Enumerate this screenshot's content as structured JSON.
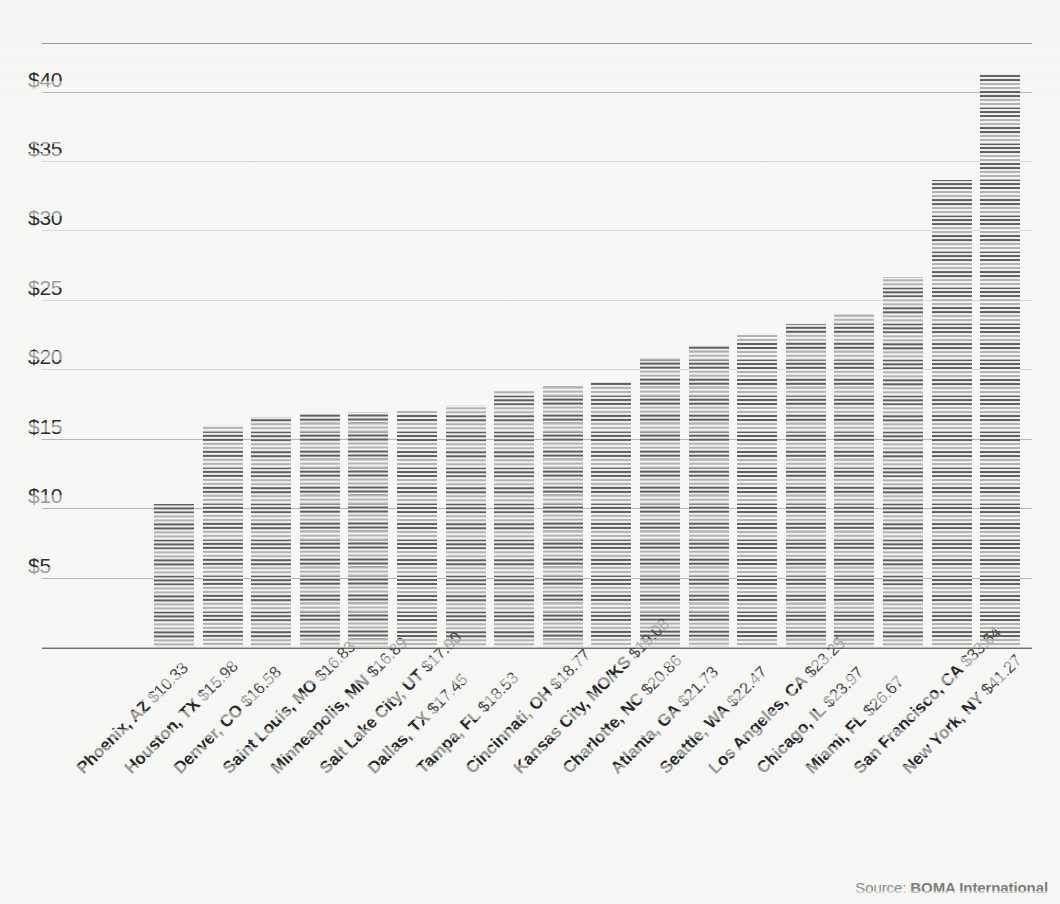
{
  "chart_data": {
    "type": "bar",
    "title": "",
    "subtitle": "",
    "xlabel": "",
    "ylabel": "",
    "ylim": [
      0,
      43.5
    ],
    "grid": true,
    "legend": null,
    "y_ticks": [
      "$5",
      "$10",
      "$15",
      "$20",
      "$25",
      "$30",
      "$35",
      "$40"
    ],
    "y_tick_values": [
      5,
      10,
      15,
      20,
      25,
      30,
      35,
      40
    ],
    "categories": [
      "Phoenix, AZ",
      "Houston, TX",
      "Denver, CO",
      "Saint Louis, MO",
      "Minneapolis, MN",
      "Salt Lake City, UT",
      "Dallas, TX",
      "Tampa, FL",
      "Cincinnati, OH",
      "Kansas City, MO/KS",
      "Charlotte, NC",
      "Atlanta, GA",
      "Seattle, WA",
      "Los Angeles, CA",
      "Chicago, IL",
      "Miami, FL",
      "San Francisco, CA",
      "New York, NY"
    ],
    "values": [
      10.33,
      15.98,
      16.58,
      16.83,
      16.89,
      17.0,
      17.45,
      18.53,
      18.77,
      19.08,
      20.86,
      21.73,
      22.47,
      23.25,
      23.97,
      26.67,
      33.64,
      41.27
    ],
    "value_labels": [
      "$10.33",
      "$15.98",
      "$16.58",
      "$16.83",
      "$16.89",
      "$17.00",
      "$17.45",
      "$18.53",
      "$18.77",
      "$19.08",
      "$20.86",
      "$21.73",
      "$22.47",
      "$23.25",
      "$23.97",
      "$26.67",
      "$33.64",
      "$41.27"
    ],
    "bar_color": "#8e8e8e",
    "background_color": "#f6f6f5",
    "gridline_color": "#b6b6b6"
  },
  "source": {
    "label": "Source:",
    "name": "BOMA International"
  }
}
